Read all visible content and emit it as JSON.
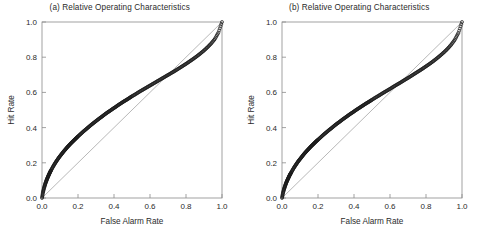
{
  "figure": {
    "background_color": "#ffffff",
    "frame_color": "#8a8a8a",
    "marker_color": "#1a1a1a",
    "diagonal_color": "#9a9a9a",
    "text_color": "#2b2b2b"
  },
  "panels": [
    {
      "key": "panel-a",
      "title": "(a) Relative Operating Characteristics",
      "xlabel": "False Alarm Rate",
      "ylabel": "Hit Rate"
    },
    {
      "key": "panel-b",
      "title": "(b) Relative Operating Characteristics",
      "xlabel": "False Alarm Rate",
      "ylabel": "Hit Rate"
    }
  ],
  "chart_data": [
    {
      "type": "scatter",
      "title": "(a) Relative Operating Characteristics",
      "xlabel": "False Alarm Rate",
      "ylabel": "Hit Rate",
      "xlim": [
        0.0,
        1.0
      ],
      "ylim": [
        0.0,
        1.0
      ],
      "xticks": [
        0.0,
        0.2,
        0.4,
        0.6,
        0.8,
        1.0
      ],
      "yticks": [
        0.0,
        0.2,
        0.4,
        0.6,
        0.8,
        1.0
      ],
      "xticklabels": [
        "0.0",
        "0.2",
        "0.4",
        "0.6",
        "0.8",
        "1.0"
      ],
      "yticklabels": [
        "0.0",
        "0.2",
        "0.4",
        "0.6",
        "0.8",
        "1.0"
      ],
      "grid": false,
      "legend": null,
      "marker": "circle",
      "marker_size": 2.0,
      "series": [
        {
          "name": "ROC curve",
          "x": [
            0.0,
            0.005,
            0.01,
            0.015,
            0.02,
            0.025,
            0.03,
            0.035,
            0.04,
            0.045,
            0.05,
            0.06,
            0.07,
            0.08,
            0.09,
            0.1,
            0.11,
            0.12,
            0.13,
            0.14,
            0.15,
            0.16,
            0.17,
            0.18,
            0.19,
            0.2,
            0.215,
            0.23,
            0.245,
            0.26,
            0.275,
            0.29,
            0.305,
            0.32,
            0.335,
            0.35,
            0.365,
            0.38,
            0.395,
            0.41,
            0.425,
            0.44,
            0.455,
            0.47,
            0.485,
            0.5,
            0.52,
            0.54,
            0.56,
            0.58,
            0.6,
            0.62,
            0.64,
            0.66,
            0.68,
            0.7,
            0.72,
            0.74,
            0.76,
            0.78,
            0.8,
            0.82,
            0.84,
            0.86,
            0.88,
            0.9,
            0.92,
            0.94,
            0.96,
            0.98,
            1.0
          ],
          "y": [
            0.0,
            0.03,
            0.052,
            0.07,
            0.086,
            0.1,
            0.113,
            0.125,
            0.136,
            0.147,
            0.157,
            0.176,
            0.193,
            0.209,
            0.224,
            0.238,
            0.251,
            0.264,
            0.276,
            0.288,
            0.299,
            0.31,
            0.32,
            0.33,
            0.34,
            0.35,
            0.364,
            0.378,
            0.391,
            0.404,
            0.417,
            0.429,
            0.441,
            0.453,
            0.464,
            0.476,
            0.487,
            0.497,
            0.508,
            0.518,
            0.529,
            0.539,
            0.549,
            0.558,
            0.568,
            0.578,
            0.59,
            0.603,
            0.615,
            0.627,
            0.639,
            0.651,
            0.663,
            0.675,
            0.687,
            0.699,
            0.711,
            0.723,
            0.736,
            0.749,
            0.762,
            0.776,
            0.79,
            0.805,
            0.821,
            0.838,
            0.857,
            0.878,
            0.903,
            0.94,
            1.0
          ]
        },
        {
          "name": "no-skill diagonal",
          "x": [
            0.0,
            1.0
          ],
          "y": [
            0.0,
            1.0
          ]
        }
      ]
    },
    {
      "type": "scatter",
      "title": "(b) Relative Operating Characteristics",
      "xlabel": "False Alarm Rate",
      "ylabel": "Hit Rate",
      "xlim": [
        0.0,
        1.0
      ],
      "ylim": [
        0.0,
        1.0
      ],
      "xticks": [
        0.0,
        0.2,
        0.4,
        0.6,
        0.8,
        1.0
      ],
      "yticks": [
        0.0,
        0.2,
        0.4,
        0.6,
        0.8,
        1.0
      ],
      "xticklabels": [
        "0.0",
        "0.2",
        "0.4",
        "0.6",
        "0.8",
        "1.0"
      ],
      "yticklabels": [
        "0.0",
        "0.2",
        "0.4",
        "0.6",
        "0.8",
        "1.0"
      ],
      "grid": false,
      "legend": null,
      "marker": "circle",
      "marker_size": 2.0,
      "series": [
        {
          "name": "ROC curve",
          "x": [
            0.0,
            0.005,
            0.01,
            0.015,
            0.02,
            0.025,
            0.03,
            0.035,
            0.04,
            0.045,
            0.05,
            0.06,
            0.07,
            0.08,
            0.09,
            0.1,
            0.11,
            0.12,
            0.13,
            0.14,
            0.15,
            0.16,
            0.17,
            0.18,
            0.19,
            0.2,
            0.215,
            0.23,
            0.245,
            0.26,
            0.275,
            0.29,
            0.305,
            0.32,
            0.335,
            0.35,
            0.365,
            0.38,
            0.395,
            0.41,
            0.425,
            0.44,
            0.455,
            0.47,
            0.485,
            0.5,
            0.52,
            0.54,
            0.56,
            0.58,
            0.6,
            0.62,
            0.64,
            0.66,
            0.68,
            0.7,
            0.72,
            0.74,
            0.76,
            0.78,
            0.8,
            0.82,
            0.84,
            0.86,
            0.88,
            0.9,
            0.92,
            0.94,
            0.96,
            0.98,
            1.0
          ],
          "y": [
            0.0,
            0.026,
            0.046,
            0.062,
            0.077,
            0.09,
            0.102,
            0.113,
            0.124,
            0.134,
            0.143,
            0.161,
            0.178,
            0.193,
            0.208,
            0.221,
            0.234,
            0.247,
            0.259,
            0.27,
            0.281,
            0.292,
            0.302,
            0.312,
            0.322,
            0.331,
            0.345,
            0.359,
            0.372,
            0.385,
            0.397,
            0.41,
            0.422,
            0.433,
            0.445,
            0.456,
            0.467,
            0.478,
            0.488,
            0.499,
            0.509,
            0.519,
            0.529,
            0.539,
            0.548,
            0.558,
            0.571,
            0.583,
            0.596,
            0.608,
            0.62,
            0.633,
            0.645,
            0.657,
            0.67,
            0.682,
            0.695,
            0.708,
            0.721,
            0.734,
            0.748,
            0.762,
            0.777,
            0.793,
            0.81,
            0.828,
            0.848,
            0.871,
            0.899,
            0.938,
            1.0
          ]
        },
        {
          "name": "no-skill diagonal",
          "x": [
            0.0,
            1.0
          ],
          "y": [
            0.0,
            1.0
          ]
        }
      ]
    }
  ]
}
